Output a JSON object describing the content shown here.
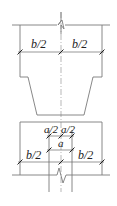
{
  "diagram": {
    "type": "structural-section",
    "line_color": "#7a7a7a",
    "text_color": "#222222",
    "upper_section": {
      "labels": {
        "left_half": "b/2",
        "right_half": "b/2"
      }
    },
    "lower_section": {
      "labels": {
        "inner_left_half": "a/2",
        "inner_right_half": "a/2",
        "inner_full": "a",
        "outer_left_half": "b/2",
        "outer_right_half": "b/2"
      }
    },
    "break_symbols": [
      "top-break",
      "bottom-break"
    ]
  }
}
